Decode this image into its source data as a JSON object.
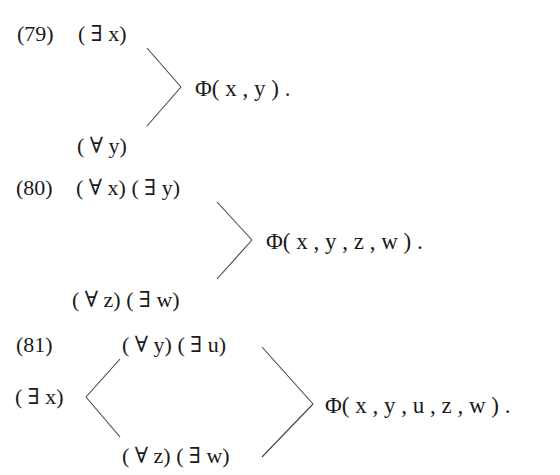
{
  "top_cutoff_text": "",
  "formulas": [
    {
      "number": "(79)",
      "upper_prefix": "( ∃ x)",
      "lower_prefix": "( ∀ y)",
      "matrix": "Φ( x , y ) ."
    },
    {
      "number": "(80)",
      "upper_prefix": "( ∀ x) ( ∃ y)",
      "lower_prefix": "( ∀ z) ( ∃ w)",
      "matrix": "Φ( x , y , z , w ) ."
    },
    {
      "number": "(81)",
      "left_prefix": "( ∃ x)",
      "upper_prefix": "( ∀ y) ( ∃ u)",
      "lower_prefix": "( ∀ z) ( ∃ w)",
      "matrix": "Φ( x , y , u , z , w ) ."
    }
  ]
}
